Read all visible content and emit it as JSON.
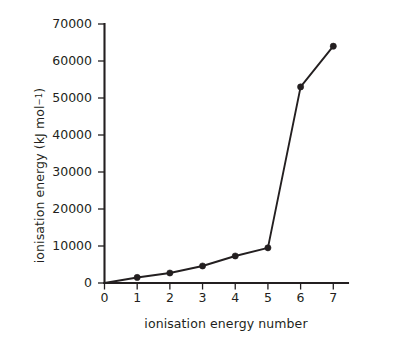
{
  "chart_data": {
    "type": "line",
    "title": "",
    "subtitle": "",
    "xlabel": "ionisation energy number",
    "ylabel": "ionisation energy (kJ mol⁻¹)",
    "ylabel_main": "ionisation energy (kJ mol",
    "ylabel_sup": "−1",
    "ylabel_tail": ")",
    "x": [
      0,
      1,
      2,
      3,
      4,
      5,
      6,
      7
    ],
    "values": [
      0,
      1500,
      2700,
      4600,
      7300,
      9500,
      53000,
      64000
    ],
    "series": [
      {
        "name": "ionisation energy",
        "x": [
          0,
          1,
          2,
          3,
          4,
          5,
          6,
          7
        ],
        "values": [
          0,
          1500,
          2700,
          4600,
          7300,
          9500,
          53000,
          64000
        ]
      }
    ],
    "xlim": [
      0,
      7.45
    ],
    "ylim": [
      0,
      70000
    ],
    "xticks": [
      0,
      1,
      2,
      3,
      4,
      5,
      6,
      7
    ],
    "xticklabels": [
      "0",
      "1",
      "2",
      "3",
      "4",
      "5",
      "6",
      "7"
    ],
    "yticks": [
      0,
      10000,
      20000,
      30000,
      40000,
      50000,
      60000,
      70000
    ],
    "yticklabels": [
      "0",
      "10000",
      "20000",
      "30000",
      "40000",
      "50000",
      "60000",
      "70000"
    ],
    "grid": false,
    "legend": false,
    "legend_position": "none",
    "marker": "filled-circle",
    "line_color": "#231f20",
    "marker_color": "#231f20",
    "axis_color": "#231f20",
    "background_color": "#ffffff"
  },
  "axes": {
    "y_title": "ionisation energy (kJ mol",
    "y_title_superscript": "−1",
    "y_title_close": ")",
    "x_title": "ionisation energy number"
  }
}
